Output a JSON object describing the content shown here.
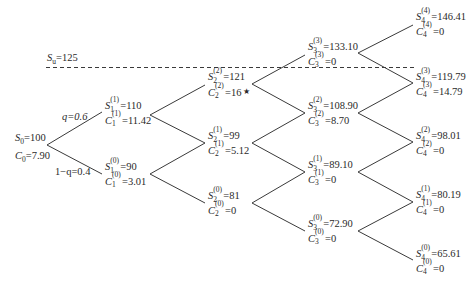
{
  "diagram": {
    "type": "binomial-tree",
    "threshold": {
      "label_symbol": "S",
      "label_sub": "u",
      "label_value": "=125"
    },
    "branch_labels": {
      "up": "q=0.6",
      "down": "1−q=0.4"
    },
    "root": {
      "s_text": "=100",
      "c_text": "=7.90"
    },
    "nodes": [
      {
        "id": "1-1",
        "t": "1",
        "k": "(1)",
        "s": "=110",
        "c": "=11.42"
      },
      {
        "id": "1-0",
        "t": "1",
        "k": "(0)",
        "s": "=90",
        "c": "=3.01"
      },
      {
        "id": "2-2",
        "t": "2",
        "k": "(2)",
        "s": "=121",
        "c": "=16",
        "marker": "★"
      },
      {
        "id": "2-1",
        "t": "2",
        "k": "(1)",
        "s": "=99",
        "c": "=5.12"
      },
      {
        "id": "2-0",
        "t": "2",
        "k": "(0)",
        "s": "=81",
        "c": "=0"
      },
      {
        "id": "3-3",
        "t": "3",
        "k": "(3)",
        "s": "=133.10",
        "c": "=0"
      },
      {
        "id": "3-2",
        "t": "3",
        "k": "(2)",
        "s": "=108.90",
        "c": "=8.70"
      },
      {
        "id": "3-1",
        "t": "3",
        "k": "(1)",
        "s": "=89.10",
        "c": "=0"
      },
      {
        "id": "3-0",
        "t": "3",
        "k": "(0)",
        "s": "=72.90",
        "c": "=0"
      },
      {
        "id": "4-4",
        "t": "4",
        "k": "(4)",
        "s": "=146.41",
        "c": "=0"
      },
      {
        "id": "4-3",
        "t": "4",
        "k": "(3)",
        "s": "=119.79",
        "c": "=14.79"
      },
      {
        "id": "4-2",
        "t": "4",
        "k": "(2)",
        "s": "=98.01",
        "c": "=0"
      },
      {
        "id": "4-1",
        "t": "4",
        "k": "(1)",
        "s": "=80.19",
        "c": "=0"
      },
      {
        "id": "4-0",
        "t": "4",
        "k": "(0)",
        "s": "=65.61",
        "c": "=0"
      }
    ],
    "symbols": {
      "s": "S",
      "c": "C",
      "zero": "0"
    }
  }
}
